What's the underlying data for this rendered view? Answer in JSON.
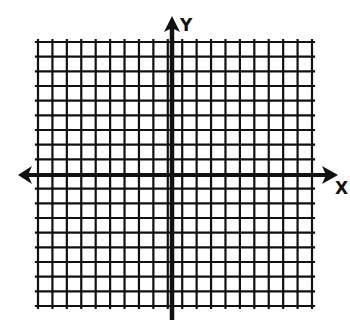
{
  "diagram": {
    "type": "coordinate-grid",
    "title": "",
    "axes": {
      "x_label": "X",
      "y_label": "Y",
      "x_arrows": [
        "left",
        "right"
      ],
      "y_arrows": [
        "up",
        "down"
      ]
    },
    "grid": {
      "columns": 19,
      "rows": 18,
      "left": 38,
      "top": 42,
      "right": 312,
      "bottom": 306,
      "origin_x": 172,
      "origin_y": 175,
      "line_color": "#111111",
      "background": "#ffffff"
    }
  }
}
